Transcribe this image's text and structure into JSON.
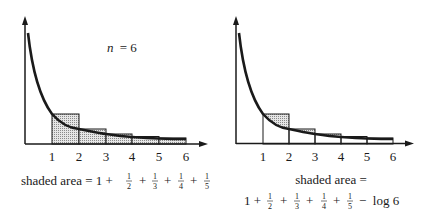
{
  "left_panel": {
    "annotation": "n = 6",
    "annotation_var": "n",
    "annotation_eq": "= 6",
    "ticks": [
      "1",
      "2",
      "3",
      "4",
      "5",
      "6"
    ],
    "caption_prefix": "shaded area = 1 +",
    "fractions": [
      {
        "num": "1",
        "den": "2"
      },
      {
        "num": "1",
        "den": "3"
      },
      {
        "num": "1",
        "den": "4"
      },
      {
        "num": "1",
        "den": "5"
      }
    ],
    "plus": "+"
  },
  "right_panel": {
    "ticks": [
      "1",
      "2",
      "3",
      "4",
      "5",
      "6"
    ],
    "caption_line1": "shaded area =",
    "caption_line2_start": "1 +",
    "fractions": [
      {
        "num": "1",
        "den": "2"
      },
      {
        "num": "1",
        "den": "3"
      },
      {
        "num": "1",
        "den": "4"
      },
      {
        "num": "1",
        "den": "5"
      }
    ],
    "plus": "+",
    "minus_term": "−  log 6"
  },
  "colors": {
    "ink": "#1a1a1a",
    "shade": "#cfcfcf"
  }
}
